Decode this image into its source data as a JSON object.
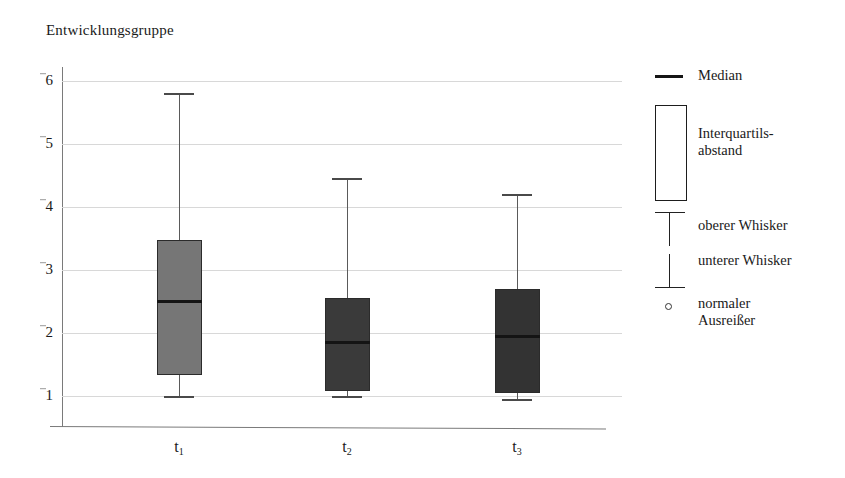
{
  "chart_data": {
    "type": "box",
    "title": "Entwicklungsgruppe",
    "xlabel": "",
    "ylabel": "",
    "ylim": [
      0.72,
      6.2
    ],
    "yticks": [
      1,
      2,
      3,
      4,
      5,
      6
    ],
    "ytick_labels": [
      "1",
      "2",
      "3",
      "4",
      "5",
      "6"
    ],
    "grid": true,
    "categories": [
      "t1",
      "t2",
      "t3"
    ],
    "category_labels": [
      "t",
      "t",
      "t"
    ],
    "category_subscripts": [
      "1",
      "2",
      "3"
    ],
    "boxes": [
      {
        "name": "t1",
        "whisker_low": 1.0,
        "q1": 1.33,
        "median": 2.5,
        "q3": 3.48,
        "whisker_high": 5.8,
        "fill": "#767676"
      },
      {
        "name": "t2",
        "whisker_low": 1.0,
        "q1": 1.08,
        "median": 1.85,
        "q3": 2.56,
        "whisker_high": 4.45,
        "fill": "#3a3a3a"
      },
      {
        "name": "t3",
        "whisker_low": 0.95,
        "q1": 1.05,
        "median": 1.95,
        "q3": 2.7,
        "whisker_high": 4.2,
        "fill": "#333333"
      }
    ],
    "legend_position": "right",
    "legend_entries": [
      {
        "key": "median",
        "label": "Median",
        "glyph": "horizontal-line"
      },
      {
        "key": "iqr",
        "label": "Interquartils-\nabstand",
        "glyph": "rectangle-outline"
      },
      {
        "key": "upper_whisker",
        "label": "oberer Whisker",
        "glyph": "tee-down"
      },
      {
        "key": "lower_whisker",
        "label": "unterer Whisker",
        "glyph": "tee-up"
      },
      {
        "key": "outlier",
        "label": "normaler\nAusreißer",
        "glyph": "small-circle"
      }
    ],
    "colors": {
      "gridline": "#d8d8d8",
      "axis": "#7a7a7a",
      "box_border": "#2b2b2b",
      "median_line": "#141414",
      "whisker": "#5a5a5a",
      "text": "#1a1a1a",
      "background": "#ffffff"
    }
  }
}
